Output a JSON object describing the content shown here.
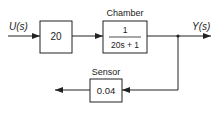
{
  "diagram": {
    "type": "block-diagram",
    "input_label": "U(s)",
    "output_label": "Y(s)",
    "blocks": [
      {
        "id": "gain",
        "title": "",
        "content": "20"
      },
      {
        "id": "chamber",
        "title": "Chamber",
        "numerator": "1",
        "denominator": "20s + 1"
      },
      {
        "id": "sensor",
        "title": "Sensor",
        "content": "0.04"
      }
    ],
    "colors": {
      "line": "#222222",
      "background": "#ffffff"
    }
  }
}
